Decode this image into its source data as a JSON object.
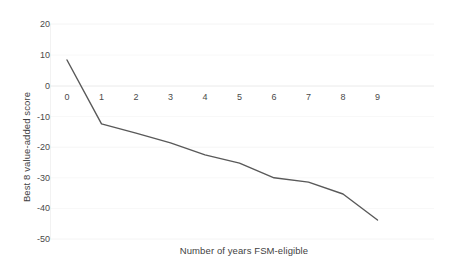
{
  "chart_data": {
    "type": "line",
    "title": "",
    "xlabel": "Number of years FSM-eligible",
    "ylabel": "Best 8 value-added score",
    "categories": [
      "0",
      "1",
      "2",
      "3",
      "4",
      "5",
      "6",
      "7",
      "8",
      "9"
    ],
    "x": [
      0,
      1,
      2,
      3,
      4,
      5,
      6,
      7,
      8,
      9
    ],
    "values": [
      8.5,
      -12.4,
      -15.4,
      -18.6,
      -22.5,
      -25.2,
      -30.0,
      -31.4,
      -35.3,
      -43.8
    ],
    "series": [
      {
        "name": "Best 8 value-added score",
        "values": [
          8.5,
          -12.4,
          -15.4,
          -18.6,
          -22.5,
          -25.2,
          -30.0,
          -31.4,
          -35.3,
          -43.8
        ],
        "color": "#595959"
      }
    ],
    "xlim": [
      0,
      9
    ],
    "ylim": [
      -50,
      20
    ],
    "y_ticks": [
      20,
      10,
      0,
      -10,
      -20,
      -30,
      -40,
      -50
    ],
    "y_tick_labels": [
      "20",
      "10",
      "0",
      "-10",
      "-20",
      "-30",
      "-40",
      "-50"
    ],
    "x_tick_labels": [
      "0",
      "1",
      "2",
      "3",
      "4",
      "5",
      "6",
      "7",
      "8",
      "9"
    ],
    "grid": true,
    "grid_axis": "y",
    "grid_color": "#f2f2f2",
    "zero_line_color": "#e8e8e8",
    "legend": false,
    "legend_position": "none",
    "line_color": "#595959",
    "line_width": 1.4,
    "markers": false,
    "background": "#ffffff",
    "text_color": "#404040"
  },
  "axes": {
    "y_title": "Best 8 value-added score",
    "x_title": "Number of years FSM-eligible"
  }
}
